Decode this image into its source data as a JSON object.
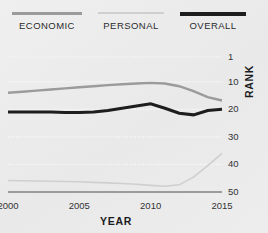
{
  "legend": {
    "items": [
      {
        "label": "ECONOMIC",
        "color": "#9b9b9b"
      },
      {
        "label": "PERSONAL",
        "color": "#cfcfcf"
      },
      {
        "label": "OVERALL",
        "color": "#1d1d1d"
      }
    ]
  },
  "axes": {
    "x_title": "YEAR",
    "y_title": "RANK",
    "x_ticks": [
      "2000",
      "2005",
      "2010",
      "2015"
    ],
    "y_ticks": [
      "1",
      "10",
      "20",
      "30",
      "40",
      "50"
    ]
  },
  "chart_data": {
    "type": "line",
    "title": "",
    "xlabel": "YEAR",
    "ylabel": "RANK",
    "xlim": [
      2000,
      2015
    ],
    "ylim": [
      1,
      50
    ],
    "y_inverted": true,
    "grid": true,
    "legend_position": "top",
    "x": [
      2000,
      2001,
      2002,
      2003,
      2004,
      2005,
      2006,
      2007,
      2008,
      2009,
      2010,
      2011,
      2012,
      2013,
      2014,
      2015
    ],
    "x_ticks": [
      2000,
      2005,
      2010,
      2015
    ],
    "y_ticks": [
      1,
      10,
      20,
      30,
      40,
      50
    ],
    "series": [
      {
        "name": "ECONOMIC",
        "color": "#9b9b9b",
        "values": [
          14,
          13.6,
          13.2,
          12.8,
          12.4,
          12.0,
          11.6,
          11.2,
          10.9,
          10.6,
          10.4,
          10.6,
          11.6,
          13.4,
          15.6,
          16.8
        ]
      },
      {
        "name": "PERSONAL",
        "color": "#cfcfcf",
        "values": [
          45.8,
          45.9,
          46.0,
          46.1,
          46.2,
          46.3,
          46.5,
          46.7,
          46.9,
          47.2,
          47.6,
          47.9,
          47.4,
          44.6,
          40.4,
          36.0
        ]
      },
      {
        "name": "OVERALL",
        "color": "#1d1d1d",
        "values": [
          21.0,
          21.0,
          21.0,
          21.0,
          21.1,
          21.1,
          21.0,
          20.4,
          19.6,
          18.8,
          18.0,
          19.6,
          21.4,
          22.0,
          20.4,
          20.0
        ]
      }
    ]
  }
}
